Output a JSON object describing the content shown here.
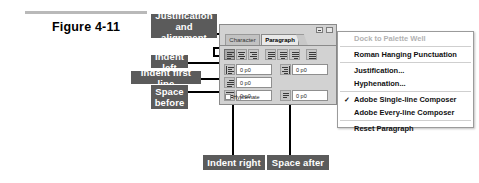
{
  "figure": {
    "label": "Figure 4-11"
  },
  "callouts": [
    {
      "id": "justification",
      "text": "Justification\nand alignment"
    },
    {
      "id": "indent-left",
      "text": "Indent left"
    },
    {
      "id": "indent-first-line",
      "text": "Indent first line"
    },
    {
      "id": "space-before",
      "text": "Space\nbefore"
    },
    {
      "id": "indent-right",
      "text": "Indent right"
    },
    {
      "id": "space-after",
      "text": "Space after"
    }
  ],
  "palette": {
    "tabs": [
      {
        "label": "Character",
        "active": false
      },
      {
        "label": "Paragraph",
        "active": true
      }
    ],
    "menu_glyph": "▸",
    "minimize_label": "_",
    "close_label": "×",
    "fields": [
      {
        "name": "indent-left",
        "value": "0 p0"
      },
      {
        "name": "indent-right",
        "value": "0 p0"
      },
      {
        "name": "indent-first-line",
        "value": "0 p0"
      },
      {
        "name": "space-before",
        "value": "0 p0"
      },
      {
        "name": "space-after",
        "value": "0 p0"
      }
    ],
    "hyphenate_label": "Hyphenate",
    "hyphenate_checked": false
  },
  "menu": {
    "items": [
      {
        "label": "Dock to Palette Well",
        "disabled": true,
        "checked": false,
        "separator_after": true
      },
      {
        "label": "Roman Hanging Punctuation",
        "disabled": false,
        "checked": false,
        "separator_after": true
      },
      {
        "label": "Justification...",
        "disabled": false,
        "checked": false,
        "separator_after": false
      },
      {
        "label": "Hyphenation...",
        "disabled": false,
        "checked": false,
        "separator_after": true
      },
      {
        "label": "Adobe Single-line Composer",
        "disabled": false,
        "checked": true,
        "separator_after": false
      },
      {
        "label": "Adobe Every-line Composer",
        "disabled": false,
        "checked": false,
        "separator_after": true
      },
      {
        "label": "Reset Paragraph",
        "disabled": false,
        "checked": false,
        "separator_after": false
      }
    ],
    "check_glyph": "✓"
  },
  "colors": {
    "callout_bg": "#5b5b5b",
    "callout_fg": "#ffffff",
    "palette_bg": "#d2d2d2",
    "menu_bg": "#ffffff",
    "rule": "#b9b9b9"
  }
}
